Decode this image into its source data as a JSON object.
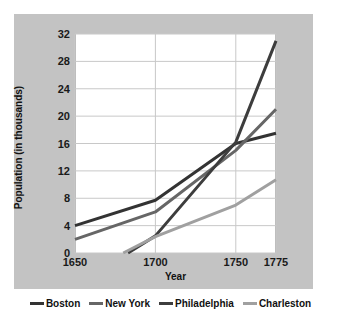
{
  "chart_data": {
    "type": "line",
    "title": "",
    "xlabel": "Year",
    "ylabel": "Population (in thousands)",
    "x": [
      1650,
      1700,
      1750,
      1775
    ],
    "xticklabels": [
      "1650",
      "1700",
      "1750",
      "1775"
    ],
    "yticks": [
      0,
      4,
      8,
      12,
      16,
      20,
      24,
      28,
      32
    ],
    "yticklabels": [
      "0",
      "4",
      "8",
      "12",
      "16",
      "20",
      "24",
      "28",
      "32"
    ],
    "xlim": [
      1650,
      1775
    ],
    "ylim": [
      0,
      32
    ],
    "grid": true,
    "legend_position": "bottom",
    "series": [
      {
        "name": "Boston",
        "color": "#333333",
        "points": [
          [
            1650,
            4.0
          ],
          [
            1700,
            7.7
          ],
          [
            1750,
            16.0
          ],
          [
            1775,
            17.5
          ]
        ]
      },
      {
        "name": "New York",
        "color": "#666666",
        "points": [
          [
            1650,
            2.0
          ],
          [
            1700,
            6.0
          ],
          [
            1750,
            15.0
          ],
          [
            1775,
            21.0
          ]
        ]
      },
      {
        "name": "Philadelphia",
        "color": "#3d3d3d",
        "points": [
          [
            1683,
            0.0
          ],
          [
            1700,
            2.5
          ],
          [
            1750,
            16.2
          ],
          [
            1775,
            31.0
          ]
        ]
      },
      {
        "name": "Charleston",
        "color": "#a0a0a0",
        "points": [
          [
            1680,
            0.0
          ],
          [
            1700,
            2.4
          ],
          [
            1750,
            7.0
          ],
          [
            1775,
            10.7
          ]
        ]
      }
    ]
  },
  "axes": {
    "ylabel_text": "Population (in thousands)",
    "xlabel_text": "Year"
  },
  "legend": {
    "items": [
      {
        "label": "Boston",
        "color": "#333333"
      },
      {
        "label": "New York",
        "color": "#666666"
      },
      {
        "label": "Philadelphia",
        "color": "#3d3d3d"
      },
      {
        "label": "Charleston",
        "color": "#a0a0a0"
      }
    ]
  },
  "colors": {
    "panel_background": "#c3c3c3",
    "plot_background": "#ffffff",
    "gridline": "#c8c8c8",
    "axis_text": "#1a1a1a"
  }
}
